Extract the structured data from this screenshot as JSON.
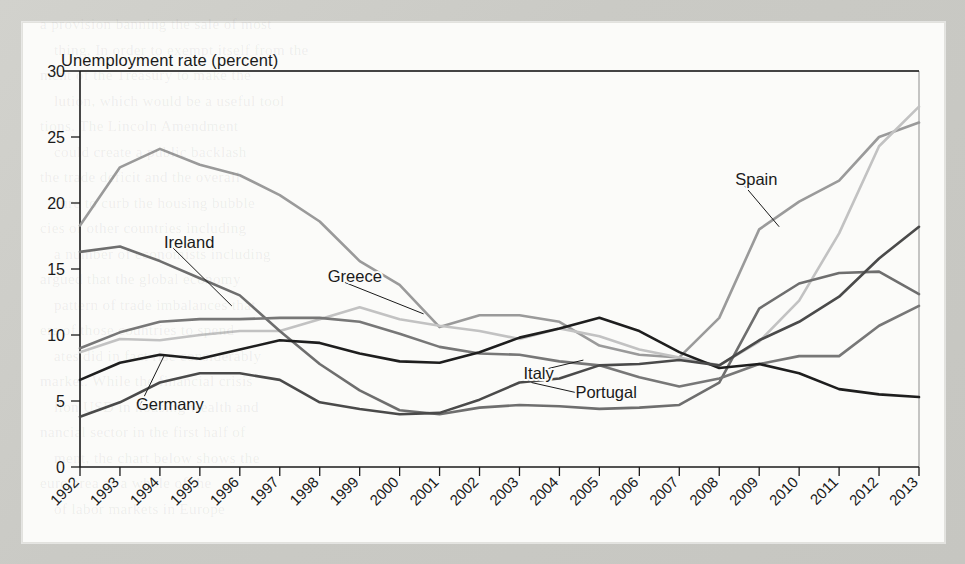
{
  "figure": {
    "axis_title": "Unemployment rate (percent)"
  },
  "background_text": [
    "a provision banning the sale of most",
    "thing. In order to exempt itself from the",
    "ment of the Treasury to make the",
    "lution, which would be a useful tool",
    "tions. The Lincoln Amendment",
    "could create a public backlash",
    "the trade deficit and the overall",
    "sure to curb the housing bubble",
    "cies of other countries including",
    "a number of economists including",
    "argued that the global economy",
    "pattern of trade imbalances that",
    "ers of those countries to spend",
    "ates did in fact rise considerably",
    "market. While the financial crisis",
    "lion USD in housing wealth and",
    "nancial sector in the first half of",
    "ment, the chart below shows the",
    "euro area as a whole of the",
    "of labor markets in Europe"
  ],
  "chart_data": {
    "type": "line",
    "title": "",
    "subtitle": "",
    "xlabel": "",
    "ylabel": "Unemployment rate (percent)",
    "ylim": [
      0,
      30
    ],
    "yticks": [
      0,
      5,
      10,
      15,
      20,
      25,
      30
    ],
    "ytick_labels": [
      "0",
      "5",
      "10",
      "15",
      "20",
      "25",
      "30"
    ],
    "grid": false,
    "legend": "inline-labels",
    "categories": [
      "1992",
      "1993",
      "1994",
      "1995",
      "1996",
      "1997",
      "1998",
      "1999",
      "2000",
      "2001",
      "2002",
      "2003",
      "2004",
      "2005",
      "2006",
      "2007",
      "2008",
      "2009",
      "2010",
      "2011",
      "2012",
      "2013"
    ],
    "series": [
      {
        "name": "Spain",
        "color": "#9a9a9a",
        "label_x": 2008.4,
        "label_y": 21.4,
        "leader_to_x": 2009.5,
        "leader_to_y": 18.2,
        "values": [
          18.3,
          22.7,
          24.1,
          22.9,
          22.1,
          20.6,
          18.6,
          15.6,
          13.8,
          10.6,
          11.5,
          11.5,
          11.0,
          9.2,
          8.5,
          8.3,
          11.3,
          18.0,
          20.1,
          21.7,
          25.0,
          26.1
        ]
      },
      {
        "name": "Greece",
        "color": "#c2c2c2",
        "label_x": 1998.2,
        "label_y": 14.0,
        "leader_to_x": 2000.6,
        "leader_to_y": 11.6,
        "values": [
          8.7,
          9.7,
          9.6,
          10.0,
          10.3,
          10.3,
          11.2,
          12.1,
          11.2,
          10.7,
          10.3,
          9.7,
          10.5,
          9.9,
          8.9,
          8.3,
          7.7,
          9.5,
          12.6,
          17.7,
          24.3,
          27.3
        ]
      },
      {
        "name": "Ireland",
        "color": "#6e6e6e",
        "label_x": 1994.1,
        "label_y": 16.6,
        "leader_to_x": 1995.8,
        "leader_to_y": 12.2,
        "values": [
          16.3,
          16.7,
          15.6,
          14.3,
          13.0,
          10.3,
          7.8,
          5.8,
          4.3,
          4.0,
          4.5,
          4.7,
          4.6,
          4.4,
          4.5,
          4.7,
          6.4,
          12.0,
          13.9,
          14.7,
          14.8,
          13.1
        ]
      },
      {
        "name": "Italy",
        "color": "#777777",
        "label_x": 2003.1,
        "label_y": 6.7,
        "leader_to_x": 2004.6,
        "leader_to_y": 8.1,
        "values": [
          9.0,
          10.2,
          11.0,
          11.2,
          11.2,
          11.3,
          11.3,
          11.0,
          10.1,
          9.1,
          8.6,
          8.5,
          8.0,
          7.7,
          6.8,
          6.1,
          6.7,
          7.8,
          8.4,
          8.4,
          10.7,
          12.2
        ]
      },
      {
        "name": "Germany",
        "color": "#1e1e1e",
        "label_x": 1993.4,
        "label_y": 4.3,
        "leader_to_x": 1994.1,
        "leader_to_y": 8.4,
        "values": [
          6.6,
          7.9,
          8.5,
          8.2,
          8.9,
          9.6,
          9.4,
          8.6,
          8.0,
          7.9,
          8.7,
          9.8,
          10.5,
          11.3,
          10.3,
          8.7,
          7.5,
          7.8,
          7.1,
          5.9,
          5.5,
          5.3
        ]
      },
      {
        "name": "Portugal",
        "color": "#4a4a4a",
        "label_x": 2004.4,
        "label_y": 5.2,
        "leader_to_x": 2003.3,
        "leader_to_y": 6.4,
        "values": [
          3.8,
          4.9,
          6.4,
          7.1,
          7.1,
          6.6,
          4.9,
          4.4,
          4.0,
          4.1,
          5.1,
          6.4,
          6.7,
          7.7,
          7.8,
          8.1,
          7.7,
          9.6,
          11.0,
          12.9,
          15.8,
          18.2
        ]
      }
    ]
  }
}
